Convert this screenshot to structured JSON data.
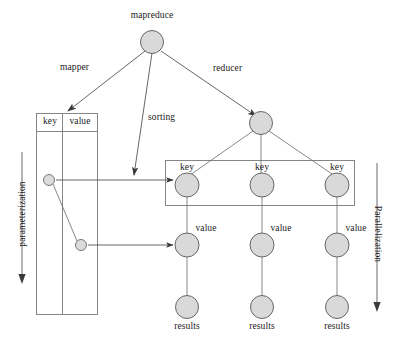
{
  "diagram": {
    "root": {
      "label": "mapreduce"
    },
    "edge_labels": {
      "mapper": "mapper",
      "sorting": "sorting",
      "reducer": "reducer"
    },
    "input_table": {
      "columns": [
        "key",
        "value"
      ]
    },
    "key_row": {
      "labels": [
        "key",
        "key",
        "key"
      ]
    },
    "value_row": {
      "labels": [
        "value",
        "value",
        "value"
      ]
    },
    "results_row": {
      "labels": [
        "results",
        "results",
        "results"
      ]
    },
    "axes": {
      "left": {
        "label": "parameterization",
        "direction": "down"
      },
      "right": {
        "label": "Parallelization",
        "direction": "down"
      }
    },
    "colors": {
      "node_fill": "#d9d9d9",
      "node_stroke": "#58585a",
      "line": "#4a4a4c",
      "background": "#ffffff",
      "text": "#1a1a1a"
    }
  }
}
